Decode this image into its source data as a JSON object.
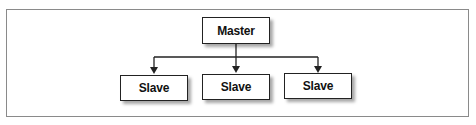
{
  "diagram": {
    "type": "tree",
    "root": {
      "id": "master",
      "label": "Master"
    },
    "children": [
      {
        "id": "slave-1",
        "label": "Slave"
      },
      {
        "id": "slave-2",
        "label": "Slave"
      },
      {
        "id": "slave-3",
        "label": "Slave"
      }
    ],
    "edges": [
      {
        "from": "master",
        "to": "slave-1",
        "arrow": "end"
      },
      {
        "from": "master",
        "to": "slave-2",
        "arrow": "end"
      },
      {
        "from": "master",
        "to": "slave-3",
        "arrow": "end"
      }
    ],
    "colors": {
      "stroke": "#222222",
      "frame": "#8a8a8a",
      "background": "#ffffff"
    }
  }
}
